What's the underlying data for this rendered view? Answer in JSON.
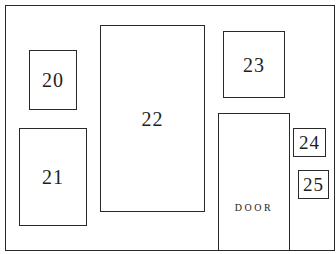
{
  "diagram": {
    "type": "floor-plan",
    "stroke_color": "#2a2a2a",
    "background": "#ffffff",
    "rooms": [
      {
        "id": "20",
        "label": "20"
      },
      {
        "id": "21",
        "label": "21"
      },
      {
        "id": "22",
        "label": "22"
      },
      {
        "id": "23",
        "label": "23"
      },
      {
        "id": "24",
        "label": "24"
      },
      {
        "id": "25",
        "label": "25"
      }
    ],
    "door": {
      "label": "DOOR"
    }
  }
}
